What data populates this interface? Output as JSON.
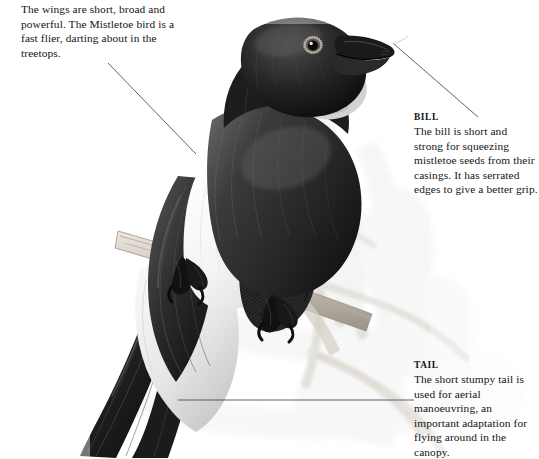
{
  "figure": {
    "background_color": "#ffffff",
    "ink_color": "#141414",
    "leader_line_color": "#3a3a3a"
  },
  "annotations": [
    {
      "id": "wings",
      "heading": "",
      "body": "The wings are short, broad and powerful. The Mistletoe bird is a fast flier, darting about in the treetops.",
      "leader": {
        "x1": 108,
        "y1": 63,
        "x2": 196,
        "y2": 154
      }
    },
    {
      "id": "bill",
      "heading": "BILL",
      "body": "The bill is short and strong for squeezing mistletoe seeds from their casings. It has serrated edges to give a better grip.",
      "leader": {
        "x1": 394,
        "y1": 44,
        "x2": 478,
        "y2": 117
      }
    },
    {
      "id": "tail",
      "heading": "TAIL",
      "body": "The short stumpy tail is used for aerial manoeuvring, an important adaptation for flying around in the canopy.",
      "leader": {
        "x1": 178,
        "y1": 400,
        "x2": 414,
        "y2": 400
      }
    }
  ],
  "illustration": {
    "bird_parts": [
      "head",
      "bill",
      "eye",
      "throat-patch",
      "back",
      "wing",
      "breast",
      "flank-patch",
      "belly",
      "tail",
      "feet"
    ],
    "scene_parts": [
      "perch-branch",
      "background-foliage"
    ]
  }
}
